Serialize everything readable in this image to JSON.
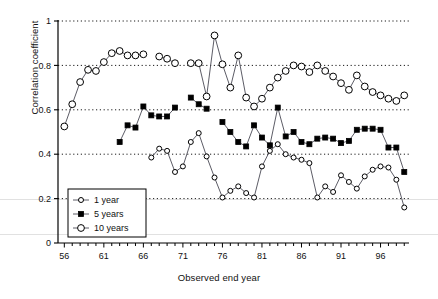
{
  "chart_data": {
    "type": "line",
    "title": "",
    "xlabel": "Observed end year",
    "ylabel": "Correlation coefficient",
    "xlim": [
      55.2,
      99.6
    ],
    "ylim": [
      0,
      1
    ],
    "xticks_labeled": [
      56,
      61,
      66,
      71,
      76,
      81,
      86,
      91,
      96
    ],
    "xtick_step_minor": 1,
    "yticks": [
      0,
      0.2,
      0.4,
      0.6,
      0.8,
      1
    ],
    "grid": "horizontal-dotted",
    "legend_position": "lower-left-inside",
    "marker_colors": {
      "open": "#ffffff",
      "edge": "#000000",
      "filled": "#000000"
    },
    "line_color": "#4a4a55",
    "series": [
      {
        "name": "1 year",
        "marker": "small-open-circle",
        "x": [
          67,
          68,
          69,
          70,
          71,
          72,
          73,
          74,
          75,
          76,
          77,
          78,
          79,
          80,
          81,
          82,
          83,
          84,
          85,
          86,
          87,
          88,
          89,
          90,
          91,
          92,
          93,
          94,
          95,
          96,
          97,
          98,
          99
        ],
        "y": [
          0.385,
          0.425,
          0.415,
          0.32,
          0.345,
          0.455,
          0.495,
          0.39,
          0.295,
          0.205,
          0.235,
          0.255,
          0.225,
          0.205,
          0.345,
          0.415,
          0.445,
          0.4,
          0.385,
          0.375,
          0.36,
          0.205,
          0.255,
          0.23,
          0.305,
          0.275,
          0.245,
          0.3,
          0.33,
          0.345,
          0.34,
          0.285,
          0.16
        ]
      },
      {
        "name": "5 years",
        "marker": "filled-square",
        "x": [
          63,
          64,
          65,
          66,
          67,
          68,
          69,
          70,
          72,
          73,
          74,
          76,
          77,
          78,
          79,
          80,
          81,
          82,
          83,
          84,
          85,
          86,
          87,
          88,
          89,
          90,
          91,
          92,
          93,
          94,
          95,
          96,
          97,
          98,
          99
        ],
        "y": [
          0.455,
          0.53,
          0.52,
          0.615,
          0.575,
          0.57,
          0.57,
          0.61,
          0.655,
          0.625,
          0.605,
          0.545,
          0.5,
          0.455,
          0.435,
          0.53,
          0.475,
          0.44,
          0.61,
          0.48,
          0.5,
          0.455,
          0.445,
          0.47,
          0.475,
          0.47,
          0.45,
          0.46,
          0.51,
          0.515,
          0.515,
          0.51,
          0.43,
          0.43,
          0.32
        ]
      },
      {
        "name": "10 years",
        "marker": "large-open-circle",
        "x": [
          56,
          57,
          58,
          59,
          60,
          61,
          62,
          63,
          64,
          65,
          66,
          68,
          69,
          70,
          72,
          73,
          74,
          75,
          76,
          77,
          78,
          79,
          80,
          81,
          82,
          83,
          84,
          85,
          86,
          87,
          88,
          89,
          90,
          91,
          92,
          93,
          94,
          95,
          96,
          97,
          98,
          99
        ],
        "y": [
          0.525,
          0.625,
          0.725,
          0.78,
          0.775,
          0.815,
          0.855,
          0.865,
          0.845,
          0.845,
          0.85,
          0.84,
          0.83,
          0.81,
          0.81,
          0.81,
          0.66,
          0.935,
          0.805,
          0.7,
          0.845,
          0.655,
          0.615,
          0.65,
          0.7,
          0.745,
          0.775,
          0.8,
          0.795,
          0.77,
          0.8,
          0.775,
          0.75,
          0.72,
          0.69,
          0.755,
          0.705,
          0.68,
          0.665,
          0.65,
          0.64,
          0.665
        ]
      }
    ]
  },
  "axis": {
    "x_tick_labels": [
      "56",
      "61",
      "66",
      "71",
      "76",
      "81",
      "86",
      "91",
      "96"
    ],
    "y_tick_labels": [
      "0",
      "0.2",
      "0.4",
      "0.6",
      "0.8",
      "1"
    ],
    "x_title": "Observed end year",
    "y_title": "Correlation coefficient"
  },
  "legend": {
    "items": [
      {
        "label": "1 year",
        "marker": "small-open-circle"
      },
      {
        "label": "5 years",
        "marker": "filled-square"
      },
      {
        "label": "10 years",
        "marker": "large-open-circle"
      }
    ]
  }
}
